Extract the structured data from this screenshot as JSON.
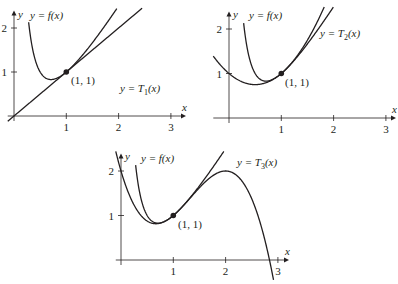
{
  "chart_data": [
    {
      "type": "line",
      "title": "",
      "xlabel": "x",
      "ylabel": "y",
      "xticks": [
        "1",
        "2",
        "3"
      ],
      "yticks": [
        "1",
        "2"
      ],
      "xlim": [
        0,
        3.2
      ],
      "ylim": [
        -0.2,
        2.3
      ],
      "series": [
        {
          "name": "y = f(x)",
          "function": "1/x + 2x - 2"
        },
        {
          "name": "y = T1(x)",
          "function": "x"
        }
      ],
      "point": {
        "x": 1,
        "y": 1,
        "label": "(1, 1)"
      },
      "labels": {
        "f": "y = f(x)",
        "t_prefix": "y = T",
        "t_sub": "1",
        "t_suffix": "(x)"
      }
    },
    {
      "type": "line",
      "title": "",
      "xlabel": "x",
      "ylabel": "y",
      "xticks": [
        "1",
        "2",
        "3"
      ],
      "yticks": [
        "1",
        "2"
      ],
      "xlim": [
        -0.3,
        3.2
      ],
      "ylim": [
        0,
        2.3
      ],
      "series": [
        {
          "name": "y = f(x)",
          "function": "1/x + 2x - 2"
        },
        {
          "name": "y = T2(x)",
          "function": "1 + (x-1) + (x-1)^2"
        }
      ],
      "point": {
        "x": 1,
        "y": 1,
        "label": "(1, 1)"
      },
      "labels": {
        "f": "y = f(x)",
        "t_prefix": "y = T",
        "t_sub": "2",
        "t_suffix": "(x)"
      }
    },
    {
      "type": "line",
      "title": "",
      "xlabel": "x",
      "ylabel": "y",
      "xticks": [
        "1",
        "2",
        "3"
      ],
      "yticks": [
        "1",
        "2"
      ],
      "xlim": [
        0,
        3.2
      ],
      "ylim": [
        -0.2,
        2.3
      ],
      "series": [
        {
          "name": "y = f(x)",
          "function": "1/x + 2x - 2"
        },
        {
          "name": "y = T3(x)",
          "function": "1 + (x-1) + (x-1)^2 - (x-1)^3"
        }
      ],
      "point": {
        "x": 1,
        "y": 1,
        "label": "(1, 1)"
      },
      "labels": {
        "f": "y = f(x)",
        "t_prefix": "y = T",
        "t_sub": "3",
        "t_suffix": "(x)"
      }
    }
  ]
}
